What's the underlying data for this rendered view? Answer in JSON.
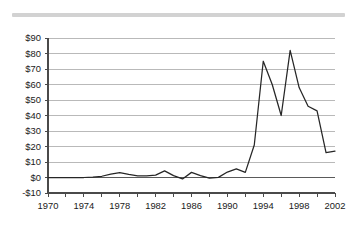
{
  "decor": {
    "top_rule_color": "#d2d2d2"
  },
  "chart_data": {
    "type": "line",
    "title": "",
    "subtitle": "",
    "xlabel": "",
    "ylabel": "",
    "grid": true,
    "legend": "none",
    "line_color": "#262626",
    "grid_color": "#9b9b9b",
    "axis_color": "#4a4a4a",
    "xlim": [
      1970,
      2002
    ],
    "ylim": [
      -10,
      90
    ],
    "ytick_step": 10,
    "xtick_step": 1,
    "xlabel_step": 4,
    "y_tick_labels": [
      "$90",
      "$80",
      "$70",
      "$60",
      "$50",
      "$40",
      "$30",
      "$20",
      "$10",
      "$0",
      "-$10"
    ],
    "y_tick_values": [
      90,
      80,
      70,
      60,
      50,
      40,
      30,
      20,
      10,
      0,
      -10
    ],
    "x_tick_labels": [
      "1970",
      "1974",
      "1978",
      "1982",
      "1986",
      "1990",
      "1994",
      "1998",
      "2002"
    ],
    "x_tick_values": [
      1970,
      1974,
      1978,
      1982,
      1986,
      1990,
      1994,
      1998,
      2002
    ],
    "x": [
      1970,
      1971,
      1972,
      1973,
      1974,
      1975,
      1976,
      1977,
      1978,
      1979,
      1980,
      1981,
      1982,
      1983,
      1984,
      1985,
      1986,
      1987,
      1988,
      1989,
      1990,
      1991,
      1992,
      1993,
      1994,
      1995,
      1996,
      1997,
      1998,
      1999,
      2000,
      2001,
      2002
    ],
    "values": [
      0,
      0,
      0,
      0,
      0,
      0.3,
      1.2,
      2.3,
      3.2,
      2.1,
      1.1,
      1.2,
      1.4,
      3.0,
      4.3,
      1.0,
      -0.9,
      1.5,
      3.3,
      1.3,
      -0.3,
      0.0,
      1.8,
      4.5,
      5.6,
      3.3,
      21.0,
      75.0,
      53.0,
      40.0,
      82.0,
      50.0,
      16.0
    ],
    "series": [
      {
        "name": "series-1",
        "points": [
          {
            "x": 1970,
            "y": 0
          },
          {
            "x": 1971,
            "y": 0
          },
          {
            "x": 1972,
            "y": 0
          },
          {
            "x": 1973,
            "y": 0
          },
          {
            "x": 1974,
            "y": 0
          },
          {
            "x": 1975,
            "y": 0.2
          },
          {
            "x": 1976,
            "y": 0.8
          },
          {
            "x": 1977,
            "y": 2.2
          },
          {
            "x": 1978,
            "y": 3.2
          },
          {
            "x": 1979,
            "y": 2.0
          },
          {
            "x": 1980,
            "y": 1.1
          },
          {
            "x": 1981,
            "y": 1.1
          },
          {
            "x": 1982,
            "y": 1.5
          },
          {
            "x": 1983,
            "y": 4.3
          },
          {
            "x": 1984,
            "y": 1.2
          },
          {
            "x": 1985,
            "y": -0.9
          },
          {
            "x": 1986,
            "y": 3.3
          },
          {
            "x": 1987,
            "y": 1.2
          },
          {
            "x": 1988,
            "y": -0.4
          },
          {
            "x": 1989,
            "y": 0.1
          },
          {
            "x": 1990,
            "y": 3.5
          },
          {
            "x": 1991,
            "y": 5.6
          },
          {
            "x": 1992,
            "y": 3.3
          },
          {
            "x": 1993,
            "y": 21.0
          },
          {
            "x": 1994,
            "y": 75.0
          },
          {
            "x": 1995,
            "y": 60.0
          },
          {
            "x": 1996,
            "y": 40.0
          },
          {
            "x": 1997,
            "y": 82.0
          },
          {
            "x": 1998,
            "y": 58.0
          },
          {
            "x": 1999,
            "y": 46.0
          },
          {
            "x": 2000,
            "y": 43.0
          },
          {
            "x": 2001,
            "y": 16.0
          },
          {
            "x": 2002,
            "y": 17.0
          }
        ]
      }
    ]
  }
}
